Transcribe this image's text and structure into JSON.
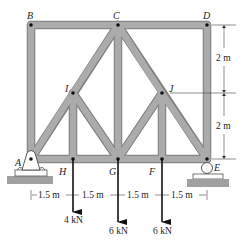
{
  "diagram": {
    "type": "truss",
    "colors": {
      "member_fill": "#a9a9a9",
      "member_edge": "#7d7d7d",
      "pin": "#111111",
      "ground": "#a0a0a0",
      "ink": "#222222"
    },
    "joints": {
      "A": {
        "label": "A"
      },
      "B": {
        "label": "B"
      },
      "C": {
        "label": "C"
      },
      "D": {
        "label": "D"
      },
      "E": {
        "label": "E"
      },
      "F": {
        "label": "F"
      },
      "G": {
        "label": "G"
      },
      "H": {
        "label": "H"
      },
      "I": {
        "label": "I"
      },
      "J": {
        "label": "J"
      }
    },
    "members": [
      "A-B",
      "B-C",
      "C-D",
      "D-E",
      "A-H",
      "H-G",
      "G-F",
      "F-E",
      "A-I",
      "I-C",
      "C-J",
      "J-E",
      "I-H",
      "I-G",
      "C-G",
      "J-G",
      "J-F"
    ],
    "supports": {
      "A": "pin",
      "E": "roller"
    },
    "dimensions": {
      "horizontal": [
        "1.5 m",
        "1.5 m",
        "1.5 m",
        "1.5 m"
      ],
      "vertical": [
        "2 m",
        "2 m"
      ]
    },
    "loads": [
      {
        "joint": "H",
        "label": "4 kN"
      },
      {
        "joint": "G",
        "label": "6 kN"
      },
      {
        "joint": "F",
        "label": "6 kN"
      }
    ]
  }
}
